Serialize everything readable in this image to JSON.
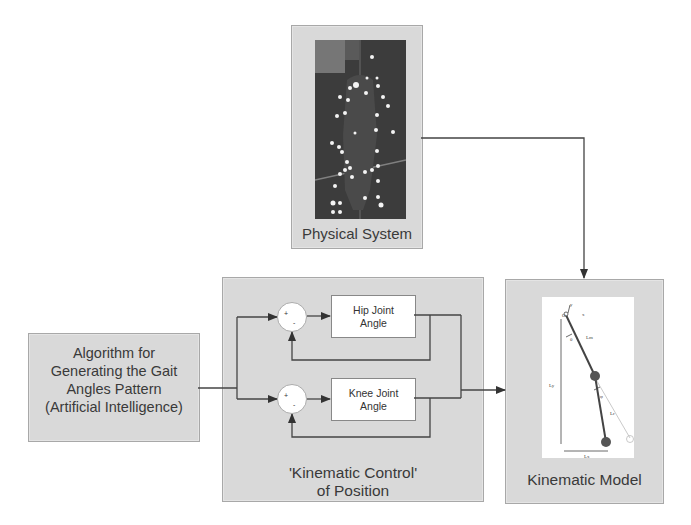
{
  "diagram": {
    "physical_system": {
      "label": "Physical System",
      "image": "motion-capture-photo-of-walking-subject-with-reflective-markers"
    },
    "algorithm": {
      "lines": [
        "Algorithm for",
        "Generating the Gait",
        "Angles Pattern",
        "(Artificial Intelligence)"
      ]
    },
    "control": {
      "title_lines": [
        "'Kinematic Control'",
        "of Position"
      ],
      "hip_block": {
        "lines": [
          "Hip Joint",
          "Angle"
        ]
      },
      "knee_block": {
        "lines": [
          "Knee Joint",
          "Angle"
        ]
      },
      "summing_junction_signs": {
        "input": "+",
        "feedback": "-"
      }
    },
    "kinematic_model": {
      "label": "Kinematic Model",
      "figure_labels": {
        "origin": "O",
        "y_axis": "y",
        "x_axis": "x",
        "thigh_angle": "θ",
        "thigh_length": "Lm",
        "shank_angle": "φ",
        "shank_length": "Lr",
        "height": "Ly",
        "horizontal": "Lx"
      }
    },
    "colors": {
      "panel_fill": "#d9d9d9",
      "panel_border": "#a8a8a8",
      "wire": "#444444",
      "block_fill": "#ffffff"
    }
  }
}
